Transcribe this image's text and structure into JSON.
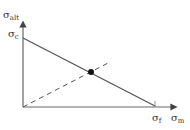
{
  "diagram": {
    "type": "goodman-style stress diagram",
    "y_axis_label": {
      "main": "σ",
      "sub": "alt"
    },
    "x_axis_label": {
      "main": "σ",
      "sub": "m"
    },
    "y_intercept_label": {
      "main": "σ",
      "sub": "c"
    },
    "x_intercept_label": {
      "main": "σ",
      "sub": "f"
    },
    "lines": [
      {
        "name": "failure-line",
        "style": "solid",
        "from": [
          23,
          38
        ],
        "to": [
          155,
          106
        ]
      },
      {
        "name": "load-line",
        "style": "dashed",
        "from": [
          23,
          107
        ],
        "to": [
          110,
          62
        ]
      }
    ],
    "intersection_point": [
      91,
      72
    ],
    "colors": {
      "axis": "#555555",
      "line": "#555555",
      "point": "#111111",
      "text": "#333333"
    }
  }
}
